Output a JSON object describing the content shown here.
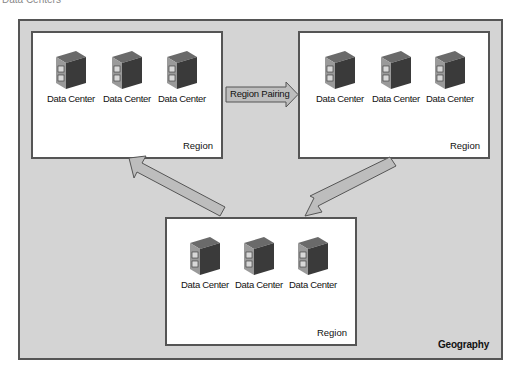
{
  "caption": "Data Centers",
  "geography": {
    "label": "Geography"
  },
  "regions": [
    {
      "label": "Region",
      "data_centers": [
        {
          "label": "Data Center"
        },
        {
          "label": "Data Center"
        },
        {
          "label": "Data Center"
        }
      ]
    },
    {
      "label": "Region",
      "data_centers": [
        {
          "label": "Data Center"
        },
        {
          "label": "Data Center"
        },
        {
          "label": "Data Center"
        }
      ]
    },
    {
      "label": "Region",
      "data_centers": [
        {
          "label": "Data Center"
        },
        {
          "label": "Data Center"
        },
        {
          "label": "Data Center"
        }
      ]
    }
  ],
  "arrows": {
    "pairing_label": "Region Pairing"
  },
  "colors": {
    "geography_fill": "#d4d4d4",
    "region_fill": "#ffffff",
    "arrow_fill": "#bdbdbd",
    "border": "#555555"
  }
}
